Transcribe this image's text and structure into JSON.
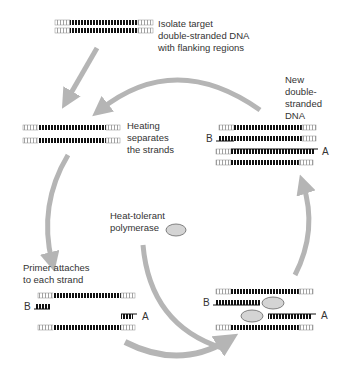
{
  "diagram": {
    "colors": {
      "arrow": "#b5b5b5",
      "strand_target": "#111111",
      "strand_flank": "#999999",
      "polymerase_fill": "#d4d4d4",
      "polymerase_stroke": "#666666",
      "text": "#333333"
    },
    "steps": [
      {
        "id": "isolate",
        "label": "Isolate target\ndouble-stranded DNA\nwith flanking regions"
      },
      {
        "id": "heating",
        "label": "Heating\nseparates\nthe strands"
      },
      {
        "id": "primer",
        "label": "Primer attaches\nto each strand"
      },
      {
        "id": "polymerase",
        "label": "Heat-tolerant\npolymerase"
      },
      {
        "id": "new_dna",
        "label": "New\ndouble-\nstranded\nDNA"
      }
    ],
    "primer_labels": {
      "primer_b": "B",
      "primer_a": "A"
    }
  }
}
